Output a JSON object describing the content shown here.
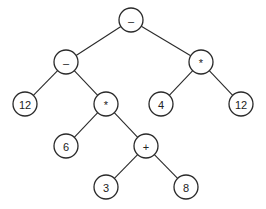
{
  "diagram": {
    "type": "expression-tree",
    "colors": {
      "stroke": "#2a2a2a",
      "fill": "#ffffff",
      "text": "#222222"
    },
    "node_radius": 12,
    "nodes": [
      {
        "id": "n0",
        "label": "–",
        "x": 131,
        "y": 20
      },
      {
        "id": "n1",
        "label": "–",
        "x": 66,
        "y": 62
      },
      {
        "id": "n2",
        "label": "*",
        "x": 201,
        "y": 62
      },
      {
        "id": "n3",
        "label": "12",
        "x": 25,
        "y": 104
      },
      {
        "id": "n4",
        "label": "*",
        "x": 106,
        "y": 104
      },
      {
        "id": "n5",
        "label": "4",
        "x": 161,
        "y": 104
      },
      {
        "id": "n6",
        "label": "12",
        "x": 241,
        "y": 104
      },
      {
        "id": "n7",
        "label": "6",
        "x": 66,
        "y": 146
      },
      {
        "id": "n8",
        "label": "+",
        "x": 146,
        "y": 146
      },
      {
        "id": "n9",
        "label": "3",
        "x": 106,
        "y": 187
      },
      {
        "id": "n10",
        "label": "8",
        "x": 186,
        "y": 187
      }
    ],
    "edges": [
      [
        "n0",
        "n1"
      ],
      [
        "n0",
        "n2"
      ],
      [
        "n1",
        "n3"
      ],
      [
        "n1",
        "n4"
      ],
      [
        "n2",
        "n5"
      ],
      [
        "n2",
        "n6"
      ],
      [
        "n4",
        "n7"
      ],
      [
        "n4",
        "n8"
      ],
      [
        "n8",
        "n9"
      ],
      [
        "n8",
        "n10"
      ]
    ]
  }
}
